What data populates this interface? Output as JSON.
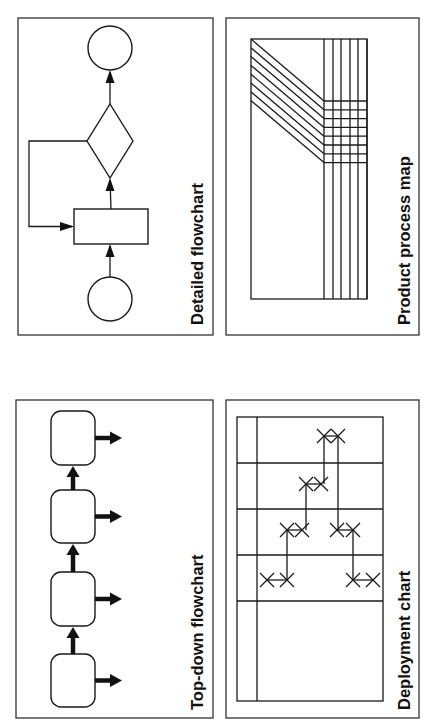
{
  "panels": [
    {
      "id": "detailed-flowchart",
      "label": "Detailed flowchart",
      "frame": {
        "x": 18,
        "y": 18,
        "w": 195,
        "h": 317
      },
      "label_pos": {
        "x": 203,
        "y": 325
      }
    },
    {
      "id": "product-process-map",
      "label": "Product process map",
      "frame": {
        "x": 226,
        "y": 18,
        "w": 193,
        "h": 317
      },
      "label_pos": {
        "x": 410,
        "y": 325
      }
    },
    {
      "id": "top-down-flowchart",
      "label": "Top-down flowchart",
      "frame": {
        "x": 16,
        "y": 400,
        "w": 197,
        "h": 318
      },
      "label_pos": {
        "x": 203,
        "y": 710
      }
    },
    {
      "id": "deployment-chart",
      "label": "Deployment chart",
      "frame": {
        "x": 226,
        "y": 400,
        "w": 193,
        "h": 318
      },
      "label_pos": {
        "x": 410,
        "y": 710
      }
    }
  ],
  "detailed_flowchart": {
    "start_circle": {
      "cx": 110,
      "cy": 299,
      "r": 22,
      "role": "start"
    },
    "process_box": {
      "x": 74,
      "y": 209,
      "w": 74,
      "h": 35,
      "role": "process"
    },
    "decision_diamond": {
      "cx": 110,
      "cy": 141,
      "hw": 23,
      "hh": 37,
      "role": "decision"
    },
    "end_circle": {
      "cx": 110,
      "cy": 48,
      "r": 22,
      "role": "end"
    },
    "feedback_loop_x": 29
  },
  "product_process_map": {
    "inner": {
      "x": 251,
      "y": 39,
      "w": 116,
      "h": 260
    },
    "diagonal_count": 8,
    "diagonal_start_y": 39,
    "diagonal_step": 8.8,
    "diagonal_end_x": 324,
    "diagonal_end_y": 101,
    "vertical_xs": [
      324,
      333,
      341,
      350,
      358,
      367
    ]
  },
  "top_down_flowchart": {
    "box_x": 51,
    "box_w": 44,
    "box_radius": 10,
    "boxes": [
      {
        "y": 411,
        "h": 54
      },
      {
        "y": 490,
        "h": 53
      },
      {
        "y": 572,
        "h": 54
      },
      {
        "y": 654,
        "h": 53
      }
    ],
    "out_arrow_end_x": 122
  },
  "deployment_chart": {
    "grid": {
      "x": 237,
      "y": 417,
      "w": 146,
      "h": 284
    },
    "lane_divider_x": 257,
    "row_lines_y": [
      463,
      509,
      555,
      601
    ],
    "marks": [
      {
        "x": 324,
        "y": 436
      },
      {
        "x": 338,
        "y": 436
      },
      {
        "x": 306,
        "y": 484
      },
      {
        "x": 321,
        "y": 484
      },
      {
        "x": 287,
        "y": 530
      },
      {
        "x": 302,
        "y": 530
      },
      {
        "x": 337,
        "y": 530
      },
      {
        "x": 353,
        "y": 530
      },
      {
        "x": 267,
        "y": 580
      },
      {
        "x": 287,
        "y": 580
      },
      {
        "x": 353,
        "y": 580
      },
      {
        "x": 373,
        "y": 580
      }
    ],
    "links": [
      {
        "x1": 324,
        "y1": 436,
        "x2": 338,
        "y2": 436
      },
      {
        "x1": 306,
        "y1": 484,
        "x2": 321,
        "y2": 484
      },
      {
        "x1": 287,
        "y1": 530,
        "x2": 302,
        "y2": 530
      },
      {
        "x1": 337,
        "y1": 530,
        "x2": 353,
        "y2": 530
      },
      {
        "x1": 267,
        "y1": 580,
        "x2": 287,
        "y2": 580
      },
      {
        "x1": 353,
        "y1": 580,
        "x2": 373,
        "y2": 580
      },
      {
        "x1": 324,
        "y1": 436,
        "x2": 324,
        "y2": 484
      },
      {
        "x1": 338,
        "y1": 436,
        "x2": 338,
        "y2": 530
      },
      {
        "x1": 306,
        "y1": 484,
        "x2": 306,
        "y2": 530
      },
      {
        "x1": 287,
        "y1": 530,
        "x2": 287,
        "y2": 580
      },
      {
        "x1": 353,
        "y1": 530,
        "x2": 353,
        "y2": 580
      }
    ]
  },
  "colors": {
    "ink": "#111111",
    "frame": "#333333",
    "background": "#ffffff"
  }
}
